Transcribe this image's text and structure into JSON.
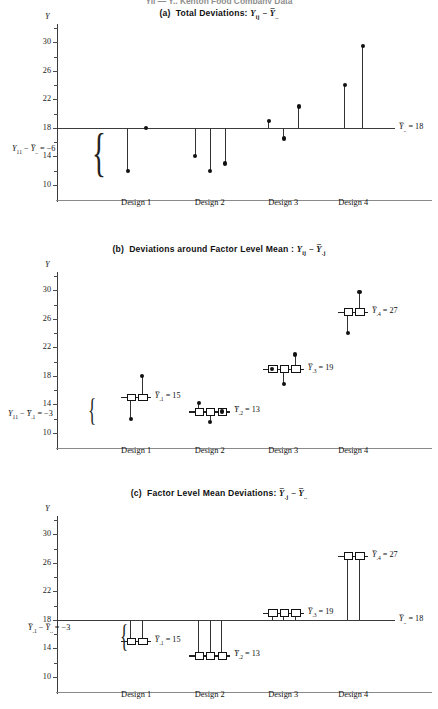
{
  "figure": {
    "caption_partial": "Yij — Y.. Kenton Food Company Data"
  },
  "axis": {
    "y_label": "Y",
    "y_ticks": [
      10,
      14,
      18,
      22,
      26,
      30
    ],
    "y_min": 9,
    "y_max": 32,
    "x_categories": [
      "Design 1",
      "Design 2",
      "Design 3",
      "Design 4"
    ]
  },
  "grand_mean": {
    "value": 18,
    "label_prefix": "Y",
    "label_sub": "..",
    "label": "= 18"
  },
  "factor_means": [
    {
      "name": "Design 1",
      "sub": ".1",
      "value": 15,
      "label": "= 15"
    },
    {
      "name": "Design 2",
      "sub": ".2",
      "value": 13,
      "label": "= 13"
    },
    {
      "name": "Design 3",
      "sub": ".3",
      "value": 19,
      "label": "= 19"
    },
    {
      "name": "Design 4",
      "sub": ".4",
      "value": 27,
      "label": "= 27"
    }
  ],
  "panels": [
    {
      "id": "a",
      "letter": "(a)",
      "title": "Total Deviations:",
      "formula_left": "Y",
      "formula_left_sub": "ij",
      "formula_minus": "−",
      "formula_right": "Y",
      "formula_right_sub": "..",
      "annotation": {
        "lhs_var": "Y",
        "lhs_sub": "11",
        "minus": "−",
        "rhs_var": "Y",
        "rhs_sub": "..",
        "equals": "= −6"
      },
      "groups": [
        {
          "name": "Design 1",
          "values": [
            12,
            18
          ]
        },
        {
          "name": "Design 2",
          "values": [
            14,
            12,
            13
          ]
        },
        {
          "name": "Design 3",
          "values": [
            19,
            16.5,
            21
          ]
        },
        {
          "name": "Design 4",
          "values": [
            24,
            29.5
          ]
        }
      ]
    },
    {
      "id": "b",
      "letter": "(b)",
      "title": "Deviations around Factor Level Mean :",
      "formula_left": "Y",
      "formula_left_sub": "ij",
      "formula_minus": "−",
      "formula_right": "Y",
      "formula_right_sub": ".j",
      "annotation": {
        "lhs_var": "Y",
        "lhs_sub": "11",
        "minus": "−",
        "rhs_var": "Y",
        "rhs_sub": ".1",
        "equals": "= −3"
      },
      "groups": [
        {
          "name": "Design 1",
          "mean": 15,
          "values": [
            12,
            18
          ]
        },
        {
          "name": "Design 2",
          "mean": 13,
          "values": [
            14.2,
            11.5,
            13
          ]
        },
        {
          "name": "Design 3",
          "mean": 19,
          "values": [
            19,
            16.8,
            21
          ]
        },
        {
          "name": "Design 4",
          "mean": 27,
          "values": [
            24,
            29.8
          ]
        }
      ]
    },
    {
      "id": "c",
      "letter": "(c)",
      "title": "Factor Level Mean Deviations:",
      "formula_left": "Y",
      "formula_left_sub": ".j",
      "formula_minus": "−",
      "formula_right": "Y",
      "formula_right_sub": "..",
      "annotation": {
        "lhs_var": "Y",
        "lhs_sub": ".1",
        "minus": "−",
        "rhs_var": "Y",
        "rhs_sub": "..",
        "equals": "= −3"
      },
      "groups": [
        {
          "name": "Design 1",
          "mean": 15,
          "count": 2
        },
        {
          "name": "Design 2",
          "mean": 13,
          "count": 3
        },
        {
          "name": "Design 3",
          "mean": 19,
          "count": 3
        },
        {
          "name": "Design 4",
          "mean": 27,
          "count": 2
        }
      ]
    }
  ]
}
